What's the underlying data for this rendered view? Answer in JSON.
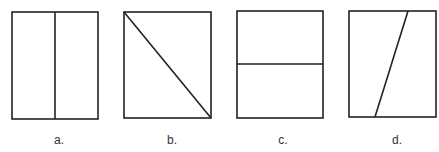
{
  "figures": [
    {
      "label": "a.",
      "division": "vertical line through middle"
    },
    {
      "label": "b.",
      "division": "diagonal from top-left to bottom-right"
    },
    {
      "label": "c.",
      "division": "horizontal line through middle"
    },
    {
      "label": "d.",
      "division": "slanted line off-center"
    }
  ],
  "colors": {
    "stroke": "#222222",
    "background": "#ffffff"
  }
}
